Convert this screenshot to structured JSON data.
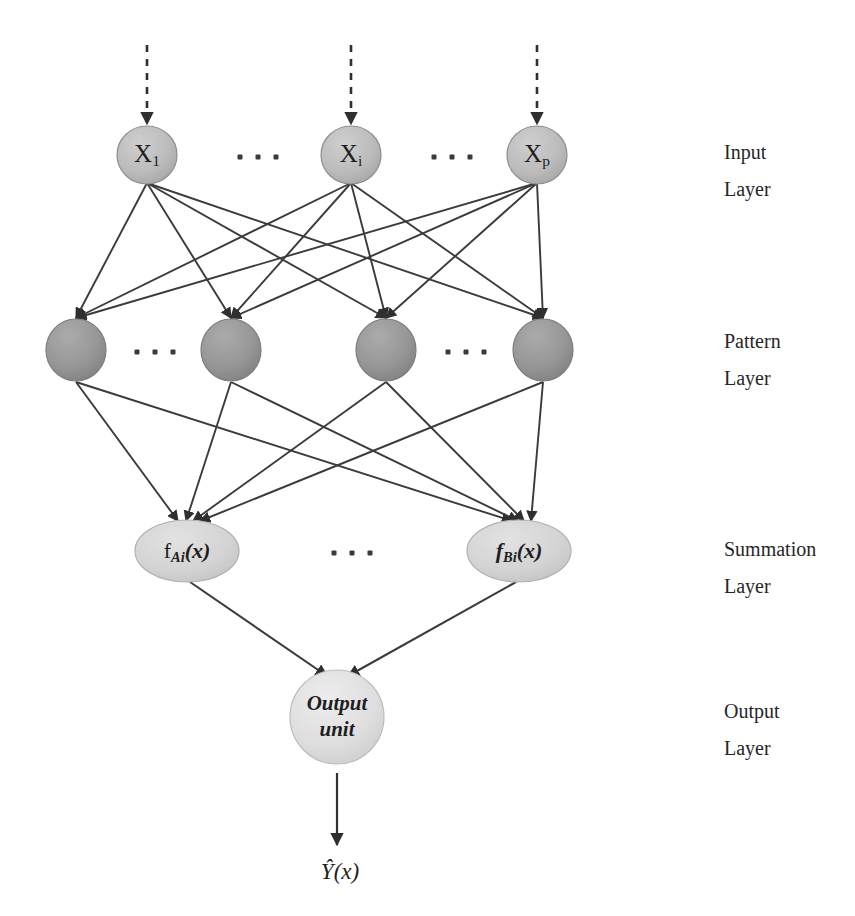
{
  "diagram": {
    "background_color": "#ffffff",
    "edge_color": "#3b3b3b",
    "input_node_color": "#b9b9b9",
    "pattern_node_color": "#949494",
    "summation_node_color": "#d2d2d2",
    "output_node_color": "#dcdcdc",
    "node_stroke_color": "#8a8a8a"
  },
  "layers": {
    "input": {
      "caption_line1": "Input",
      "caption_line2": "Layer",
      "nodes": [
        {
          "base": "X",
          "sub": "1"
        },
        {
          "base": "X",
          "sub": "i"
        },
        {
          "base": "X",
          "sub": "p"
        }
      ],
      "ellipses_count": 2
    },
    "pattern": {
      "caption_line1": "Pattern",
      "caption_line2": "Layer",
      "nodes": [
        {
          "base": "",
          "sub": ""
        },
        {
          "base": "",
          "sub": ""
        },
        {
          "base": "",
          "sub": ""
        },
        {
          "base": "",
          "sub": ""
        }
      ],
      "ellipses_count": 2
    },
    "summation": {
      "caption_line1": "Summation",
      "caption_line2": "Layer",
      "nodes": [
        {
          "fn": "f",
          "sub": "Ai",
          "arg": "(x)"
        },
        {
          "fn": "f",
          "sub": "Bi",
          "arg": "(x)"
        }
      ],
      "ellipses_count": 1
    },
    "output": {
      "caption_line1": "Output",
      "caption_line2": "Layer",
      "node_line1": "Output",
      "node_line2": "unit",
      "result_label": "Ŷ(x)"
    }
  },
  "ellipsis_dots": "▪ ▪ ▪"
}
